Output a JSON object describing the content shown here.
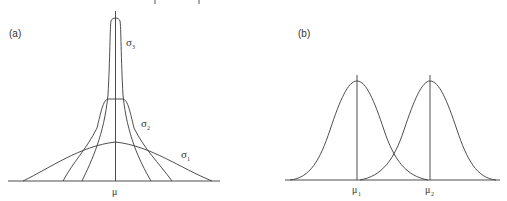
{
  "panels": {
    "a": {
      "label": "(a)",
      "mean_label": "μ",
      "curves": [
        {
          "name": "σ1",
          "symbol": "σ",
          "subscript": "1"
        },
        {
          "name": "σ2",
          "symbol": "σ",
          "subscript": "2"
        },
        {
          "name": "σ3",
          "symbol": "σ",
          "subscript": "3"
        }
      ]
    },
    "b": {
      "label": "(b)",
      "means": [
        {
          "symbol": "μ",
          "subscript": "1"
        },
        {
          "symbol": "μ",
          "subscript": "2"
        }
      ]
    }
  },
  "colors": {
    "line": "#3a3a3a",
    "background": "#ffffff"
  }
}
